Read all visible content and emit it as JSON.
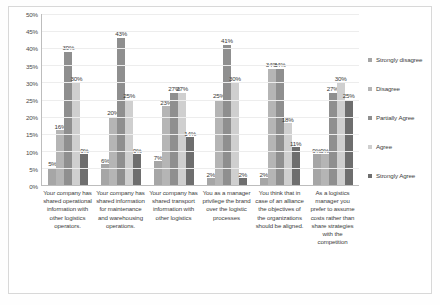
{
  "chart_data": {
    "type": "bar",
    "title": "",
    "subtitle": "",
    "xlabel": "",
    "ylabel": "",
    "ylim": [
      0,
      50
    ],
    "y_tick_labels": [
      "50%",
      "45%",
      "40%",
      "35%",
      "30%",
      "25%",
      "20%",
      "15%",
      "10%",
      "5%",
      "0%"
    ],
    "y_tick_values": [
      50,
      45,
      40,
      35,
      30,
      25,
      20,
      15,
      10,
      5,
      0
    ],
    "grid": true,
    "legend_position": "right",
    "value_suffix": "%",
    "categories": [
      "Your company has shared operational information with other logistics operators.",
      "Your company has shared information for maintenance and warehousing operations.",
      "Your company has shared transport information with other logistics",
      "You as a manager privilege the brand over the logistic processes",
      "You think that in case of an alliance the objectives of the organizations should be aligned.",
      "As a logistics manager you prefer to assume costs rather than share strategies with the competition"
    ],
    "series": [
      {
        "name": "Strongly disagree",
        "color": "#a6a6a6",
        "values": [
          5,
          6,
          7,
          2,
          2,
          9
        ],
        "labels": [
          "5%",
          "6%",
          "7%",
          "2%",
          "2%",
          "9%"
        ]
      },
      {
        "name": "Disagree",
        "color": "#b5b5b5",
        "values": [
          16,
          20,
          23,
          25,
          34,
          9
        ],
        "labels": [
          "16%",
          "20%",
          "23%",
          "25%",
          "34%",
          "9%"
        ]
      },
      {
        "name": "Partially Agree",
        "color": "#8f8f8f",
        "values": [
          39,
          43,
          27,
          41,
          34,
          27
        ],
        "labels": [
          "39%",
          "43%",
          "27%",
          "41%",
          "34%",
          "27%"
        ]
      },
      {
        "name": "Agree",
        "color": "#cfcfcf",
        "values": [
          30,
          25,
          27,
          30,
          18,
          30
        ],
        "labels": [
          "30%",
          "25%",
          "27%",
          "30%",
          "18%",
          "30%"
        ]
      },
      {
        "name": "Strongly Agree",
        "color": "#6e6e6e",
        "values": [
          9,
          9,
          14,
          2,
          11,
          25
        ],
        "labels": [
          "9%",
          "9%",
          "14%",
          "2%",
          "11%",
          "25%"
        ]
      }
    ]
  }
}
